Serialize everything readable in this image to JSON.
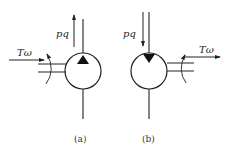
{
  "diagram": {
    "a": {
      "flow_label": "pq",
      "torque_label": "Tω",
      "caption": "(a)",
      "symbol": "pump",
      "triangle_direction": "up"
    },
    "b": {
      "flow_label": "pq",
      "torque_label": "Tω",
      "caption": "(b)",
      "symbol": "motor",
      "triangle_direction": "down"
    },
    "colors": {
      "stroke": "#222222",
      "background": "#ffffff"
    }
  }
}
